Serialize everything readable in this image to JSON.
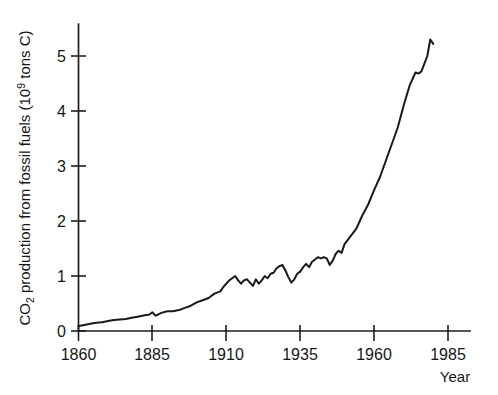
{
  "chart_data": {
    "type": "line",
    "title": "",
    "subtitle": "",
    "xlabel": "Year",
    "ylabel": "CO2 production from fossil fuels (10^9 tons C)",
    "ylabel_parts": {
      "prefix": "CO",
      "sub": "2",
      "middle": " production from fossil fuels (10",
      "sup": "9",
      "suffix": " tons C)"
    },
    "xlim": [
      1860,
      1985
    ],
    "ylim": [
      0,
      5.6
    ],
    "xticks": [
      1860,
      1885,
      1910,
      1935,
      1960,
      1985
    ],
    "xtick_labels": [
      "1860",
      "1885",
      "1910",
      "1935",
      "1960",
      "1985"
    ],
    "yticks": [
      0,
      1,
      2,
      3,
      4,
      5
    ],
    "ytick_labels": [
      "0",
      "1",
      "2",
      "3",
      "4",
      "5"
    ],
    "grid": false,
    "legend": false,
    "legend_position": "none",
    "line_color": "#191919",
    "background_color": "#ffffff",
    "series": [
      {
        "name": "CO2 production from fossil fuels",
        "units": "10^9 tons C",
        "x": [
          1860,
          1862,
          1864,
          1866,
          1868,
          1870,
          1872,
          1874,
          1876,
          1878,
          1880,
          1882,
          1884,
          1885,
          1886,
          1887,
          1888,
          1890,
          1892,
          1894,
          1896,
          1898,
          1900,
          1902,
          1904,
          1906,
          1908,
          1909,
          1910,
          1911,
          1912,
          1913,
          1914,
          1915,
          1916,
          1917,
          1918,
          1919,
          1920,
          1921,
          1922,
          1923,
          1924,
          1925,
          1926,
          1927,
          1928,
          1929,
          1930,
          1931,
          1932,
          1933,
          1934,
          1935,
          1936,
          1937,
          1938,
          1939,
          1940,
          1941,
          1942,
          1943,
          1944,
          1945,
          1946,
          1947,
          1948,
          1949,
          1950,
          1952,
          1954,
          1956,
          1958,
          1960,
          1962,
          1964,
          1966,
          1968,
          1970,
          1972,
          1974,
          1975,
          1976,
          1978,
          1979,
          1980
        ],
        "y": [
          0.09,
          0.11,
          0.13,
          0.15,
          0.16,
          0.18,
          0.2,
          0.21,
          0.22,
          0.24,
          0.26,
          0.28,
          0.3,
          0.34,
          0.28,
          0.3,
          0.33,
          0.36,
          0.36,
          0.38,
          0.42,
          0.46,
          0.52,
          0.56,
          0.6,
          0.68,
          0.72,
          0.8,
          0.86,
          0.92,
          0.96,
          1.0,
          0.92,
          0.86,
          0.92,
          0.94,
          0.88,
          0.82,
          0.94,
          0.86,
          0.92,
          1.0,
          0.96,
          1.04,
          1.06,
          1.14,
          1.18,
          1.2,
          1.1,
          0.98,
          0.88,
          0.94,
          1.04,
          1.08,
          1.16,
          1.22,
          1.16,
          1.26,
          1.3,
          1.34,
          1.32,
          1.34,
          1.32,
          1.2,
          1.28,
          1.4,
          1.46,
          1.42,
          1.58,
          1.72,
          1.86,
          2.1,
          2.3,
          2.56,
          2.8,
          3.1,
          3.4,
          3.7,
          4.1,
          4.46,
          4.7,
          4.68,
          4.72,
          5.0,
          5.3,
          5.22
        ]
      }
    ],
    "annotations": [],
    "notes": {
      "start_value": 0.09,
      "start_year": 1860,
      "peak_value": 5.3,
      "peak_year": 1979,
      "end_value": 5.22,
      "end_year": 1980
    }
  },
  "axes": {
    "x_axis_name": "year-axis",
    "y_axis_name": "co2-production-axis"
  }
}
